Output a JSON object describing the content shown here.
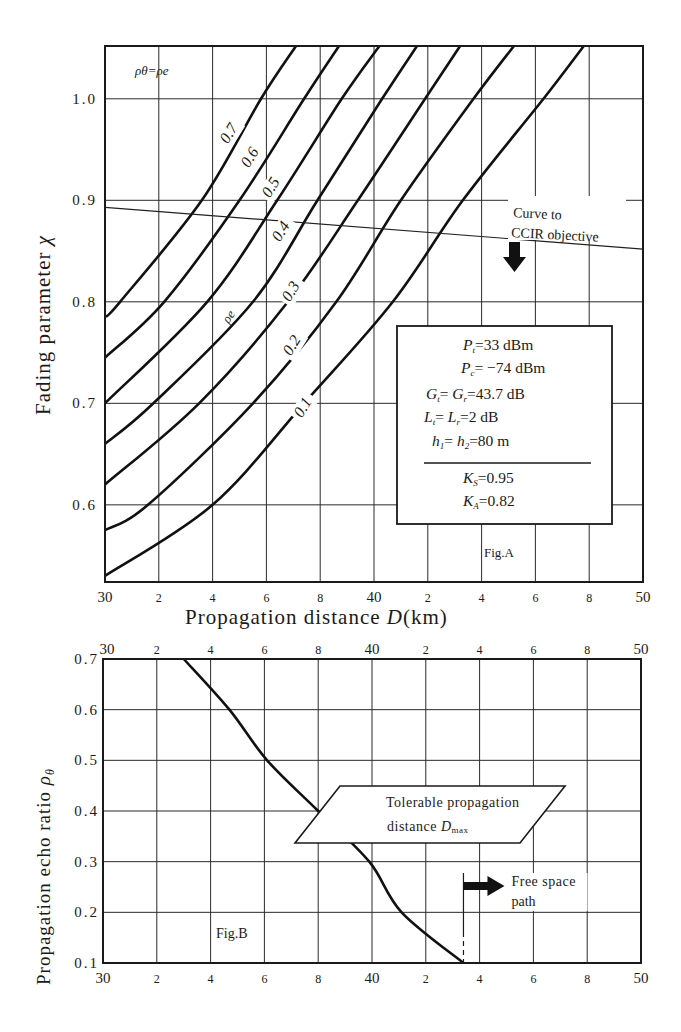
{
  "chart_data": [
    {
      "id": "fig_a",
      "type": "line",
      "title": "Fig. A",
      "xlabel": "Propagation distance D (km)",
      "ylabel": "Fading parameter χ",
      "xlim": [
        30,
        50
      ],
      "ylim": [
        0.524,
        1.052
      ],
      "grid": true,
      "x_ticks": [
        30,
        32,
        34,
        36,
        38,
        40,
        42,
        44,
        46,
        48,
        50
      ],
      "x_tick_labels": [
        "30",
        "2",
        "4",
        "6",
        "8",
        "40",
        "2",
        "4",
        "6",
        "8",
        "50"
      ],
      "y_ticks": [
        0.6,
        0.7,
        0.8,
        0.9,
        1.0
      ],
      "y_tick_labels": [
        "0.6",
        "0.7",
        "0.8",
        "0.9",
        "1.0"
      ],
      "legend_note": "ρθ=ρe",
      "series_label_note": "ρe",
      "series": [
        {
          "name": "0.7",
          "x": [
            30.0,
            30.56,
            33.6,
            35.8,
            37.1
          ],
          "y": [
            0.785,
            0.8,
            0.9,
            1.0,
            1.052
          ]
        },
        {
          "name": "0.6",
          "x": [
            30.0,
            32.2,
            35.0,
            37.4,
            38.7
          ],
          "y": [
            0.745,
            0.8,
            0.9,
            1.0,
            1.052
          ]
        },
        {
          "name": "0.5",
          "x": [
            30.0,
            33.8,
            36.4,
            38.8,
            40.2
          ],
          "y": [
            0.7,
            0.8,
            0.9,
            1.0,
            1.052
          ]
        },
        {
          "name": "0.4",
          "x": [
            30.0,
            31.8,
            35.5,
            37.9,
            40.3,
            41.6
          ],
          "y": [
            0.66,
            0.7,
            0.8,
            0.9,
            1.0,
            1.052
          ]
        },
        {
          "name": "0.3",
          "x": [
            30.0,
            33.5,
            36.8,
            39.4,
            41.9,
            43.2
          ],
          "y": [
            0.62,
            0.7,
            0.8,
            0.9,
            1.0,
            1.052
          ]
        },
        {
          "name": "0.2",
          "x": [
            30.0,
            31.6,
            35.5,
            38.6,
            41.0,
            43.7,
            45.2
          ],
          "y": [
            0.575,
            0.6,
            0.7,
            0.8,
            0.9,
            1.0,
            1.052
          ]
        },
        {
          "name": "0.1",
          "x": [
            30.0,
            34.0,
            37.4,
            40.7,
            43.3,
            46.3,
            47.8
          ],
          "y": [
            0.53,
            0.6,
            0.7,
            0.8,
            0.9,
            1.0,
            1.052
          ]
        }
      ],
      "reference_line": {
        "name": "Curve to CCIR objective",
        "x": [
          30,
          50
        ],
        "y": [
          0.893,
          0.852
        ],
        "annotation": [
          "Curve to",
          "CCIR objective"
        ]
      },
      "parameter_box": [
        {
          "sym": "P",
          "sub": "t",
          "rest": "=33 dBm"
        },
        {
          "sym": "P",
          "sub": "c",
          "rest": "= −74 dBm"
        },
        {
          "sym": "G",
          "sub": "t",
          "rest": "= ",
          "sym2": "G",
          "sub2": "r",
          "rest2": "=43.7 dB"
        },
        {
          "sym": "L",
          "sub": "t",
          "rest": "= ",
          "sym2": "L",
          "sub2": "r",
          "rest2": "=2 dB"
        },
        {
          "sym": "h",
          "sub": "1",
          "rest": "= ",
          "sym2": "h",
          "sub2": "2",
          "rest2": "=80 m"
        },
        {
          "sym": "K",
          "sub": "S",
          "rest": "=0.95"
        },
        {
          "sym": "K",
          "sub": "A",
          "rest": "=0.82"
        }
      ]
    },
    {
      "id": "fig_b",
      "type": "line",
      "title": "Fig. B",
      "xlabel": "Propagation distance D (km)",
      "ylabel": "Propagation echo ratio ρθ",
      "xlim": [
        30,
        50
      ],
      "ylim": [
        0.1,
        0.7
      ],
      "grid": true,
      "x_ticks": [
        30,
        32,
        34,
        36,
        38,
        40,
        42,
        44,
        46,
        48,
        50
      ],
      "x_tick_labels": [
        "30",
        "2",
        "4",
        "6",
        "8",
        "40",
        "2",
        "4",
        "6",
        "8",
        "50"
      ],
      "y_ticks": [
        0.1,
        0.2,
        0.3,
        0.4,
        0.5,
        0.6,
        0.7
      ],
      "y_tick_labels": [
        "0.1",
        "0.2",
        "0.3",
        "0.4",
        "0.5",
        "0.6",
        "0.7"
      ],
      "series": [
        {
          "name": "Tolerable propagation distance Dmax",
          "x": [
            33.0,
            34.7,
            36.1,
            38.0,
            39.9,
            41.1,
            43.4
          ],
          "y": [
            0.7,
            0.6,
            0.5,
            0.4,
            0.3,
            0.2,
            0.1
          ]
        }
      ],
      "annotations": {
        "callout": [
          "Tolerable propagation",
          "distance D",
          "max"
        ],
        "free_space": [
          "Free space",
          "path"
        ],
        "free_space_x": 43.4
      }
    }
  ],
  "axis_titles": {
    "x": "Propagation distance",
    "x_var": "D",
    "x_unit": "(km)",
    "y_a_prefix": "Fading parameter",
    "y_a_var": "χ",
    "y_b_prefix": "Propagation echo ratio",
    "y_b_var": "ρθ"
  }
}
